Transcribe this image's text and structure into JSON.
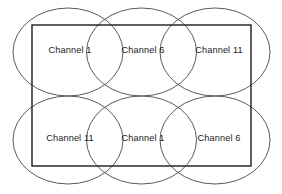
{
  "diagram": {
    "colors": {
      "circle_stroke": "#5a5a5a",
      "rect_stroke": "#1c1c1c",
      "label_text": "#1a1a1a",
      "background": "#ffffff"
    },
    "coverage_area": {
      "shape": "rectangle",
      "x": 32,
      "y": 25,
      "width": 219,
      "height": 141
    },
    "cells": [
      {
        "id": "cell-r1c1",
        "label": "Channel 1",
        "channel": 1,
        "row": 1,
        "col": 1,
        "cx": 68,
        "cy": 52,
        "rx": 55,
        "ry": 44,
        "label_x": 70,
        "label_y": 51
      },
      {
        "id": "cell-r1c2",
        "label": "Channel 6",
        "channel": 6,
        "row": 1,
        "col": 2,
        "cx": 141.5,
        "cy": 52,
        "rx": 55,
        "ry": 44,
        "label_x": 143,
        "label_y": 51
      },
      {
        "id": "cell-r1c3",
        "label": "Channel 11",
        "channel": 11,
        "row": 1,
        "col": 3,
        "cx": 215,
        "cy": 52,
        "rx": 55,
        "ry": 44,
        "label_x": 219,
        "label_y": 51
      },
      {
        "id": "cell-r2c1",
        "label": "Channel 11",
        "channel": 11,
        "row": 2,
        "col": 1,
        "cx": 68,
        "cy": 140,
        "rx": 55,
        "ry": 44,
        "label_x": 70,
        "label_y": 139
      },
      {
        "id": "cell-r2c2",
        "label": "Channel 1",
        "channel": 1,
        "row": 2,
        "col": 2,
        "cx": 141.5,
        "cy": 140,
        "rx": 55,
        "ry": 44,
        "label_x": 143,
        "label_y": 139
      },
      {
        "id": "cell-r2c3",
        "label": "Channel 6",
        "channel": 6,
        "row": 2,
        "col": 3,
        "cx": 215,
        "cy": 140,
        "rx": 55,
        "ry": 44,
        "label_x": 219,
        "label_y": 139
      }
    ]
  }
}
